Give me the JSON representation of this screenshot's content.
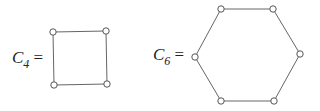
{
  "graphs": [
    {
      "label": "C",
      "subscript": "4",
      "equals": "=",
      "vertices": [
        [
          53,
          32
        ],
        [
          106,
          31
        ],
        [
          107,
          84
        ],
        [
          54,
          85
        ]
      ]
    },
    {
      "label": "C",
      "subscript": "6",
      "equals": "=",
      "vertices": [
        [
          221,
          9
        ],
        [
          273,
          9
        ],
        [
          300,
          54
        ],
        [
          274,
          101
        ],
        [
          221,
          101
        ],
        [
          195,
          57
        ]
      ]
    }
  ],
  "colors": {
    "edge": "#666666",
    "vertex_fill": "#ffffff",
    "vertex_stroke": "#555555"
  }
}
